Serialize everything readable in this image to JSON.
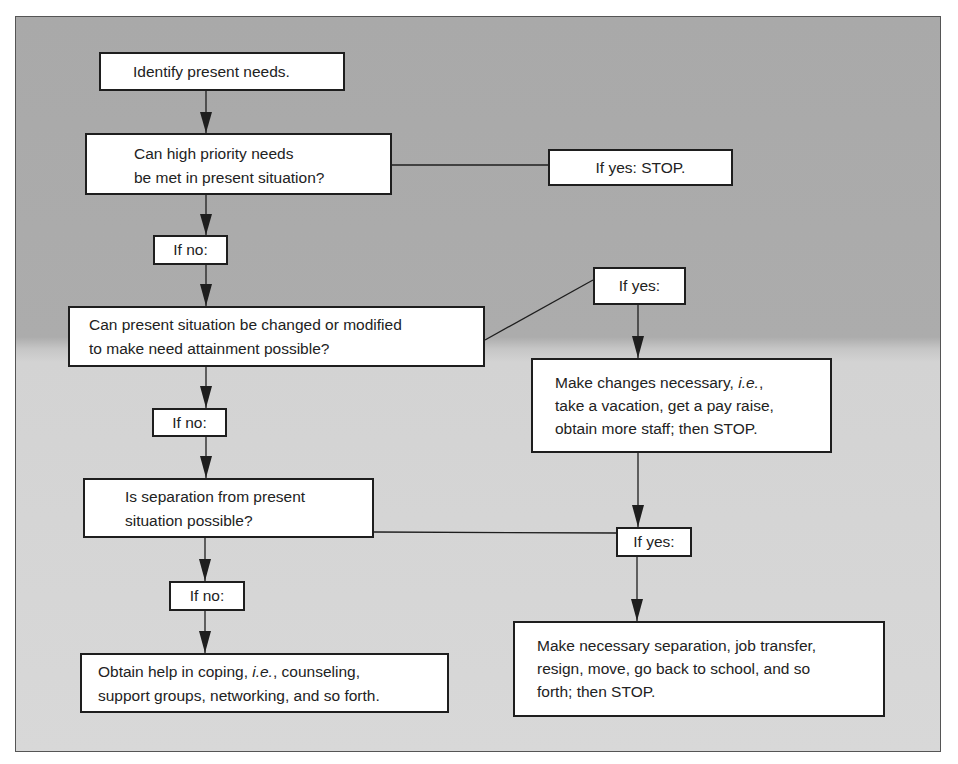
{
  "diagram": {
    "type": "flowchart",
    "colors": {
      "background_top": "#a9a9a9",
      "background_bottom": "#d6d6d6",
      "box_fill": "#ffffff",
      "box_border": "#1e1e1e",
      "line": "#1e1e1e"
    },
    "nodes": {
      "identify": {
        "lines": [
          "Identify present needs."
        ]
      },
      "q_high_priority": {
        "lines": [
          "Can high priority needs",
          "be met in present situation?"
        ]
      },
      "yes_stop_1": {
        "lines": [
          "If yes: STOP."
        ]
      },
      "no_1": {
        "lines": [
          "If no:"
        ]
      },
      "q_change": {
        "lines": [
          "Can present situation be changed or modified",
          "to make need attainment possible?"
        ]
      },
      "yes_2": {
        "lines": [
          "If yes:"
        ]
      },
      "make_changes": {
        "line1_pre": "Make changes necessary, ",
        "line1_ital": "i.e.",
        "line1_post": ",",
        "line2": "take a vacation, get a pay raise,",
        "line3": "obtain more staff; then STOP."
      },
      "no_2": {
        "lines": [
          "If no:"
        ]
      },
      "q_separation": {
        "lines": [
          "Is separation from present",
          "situation possible?"
        ]
      },
      "yes_3": {
        "lines": [
          "If yes:"
        ]
      },
      "no_3": {
        "lines": [
          "If no:"
        ]
      },
      "obtain_help": {
        "line1_pre": "Obtain help in coping, ",
        "line1_ital": "i.e.",
        "line1_post": ", counseling,",
        "line2": "support groups, networking, and so forth."
      },
      "make_separation": {
        "line1": "Make necessary separation, job transfer,",
        "line2": "resign, move, go back to school, and so",
        "line3": "forth; then STOP."
      }
    },
    "edges": [
      {
        "from": "identify",
        "to": "q_high_priority",
        "arrow": true
      },
      {
        "from": "q_high_priority",
        "to": "yes_stop_1",
        "arrow": false
      },
      {
        "from": "q_high_priority",
        "to": "no_1",
        "arrow": true
      },
      {
        "from": "no_1",
        "to": "q_change",
        "arrow": true
      },
      {
        "from": "q_change",
        "to": "yes_2",
        "arrow": false
      },
      {
        "from": "yes_2",
        "to": "make_changes",
        "arrow": true
      },
      {
        "from": "q_change",
        "to": "no_2",
        "arrow": true
      },
      {
        "from": "no_2",
        "to": "q_separation",
        "arrow": true
      },
      {
        "from": "make_changes",
        "to": "yes_3",
        "arrow": true
      },
      {
        "from": "q_separation",
        "to": "yes_3",
        "arrow": false
      },
      {
        "from": "q_separation",
        "to": "no_3",
        "arrow": true
      },
      {
        "from": "no_3",
        "to": "obtain_help",
        "arrow": true
      },
      {
        "from": "yes_3",
        "to": "make_separation",
        "arrow": true
      }
    ]
  }
}
